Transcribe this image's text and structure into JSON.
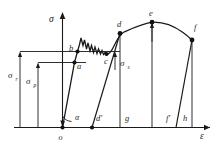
{
  "figure": {
    "background_color": "#ffffff",
    "line_color": "#1a1a1a"
  },
  "axes": {
    "y_axis_label": "σ",
    "x_axis_label": "ε",
    "origin_label": "o",
    "angle_label": "α"
  },
  "stress_markers": [
    {
      "name": "sigma-r",
      "symbol": "σ",
      "subscript": "r",
      "level": "upper"
    },
    {
      "name": "sigma-p",
      "symbol": "σ",
      "subscript": "p",
      "level": "lower"
    },
    {
      "name": "sigma-s",
      "symbol": "σ",
      "subscript": "s",
      "level": "upper-right"
    }
  ],
  "curve_points": [
    {
      "label": "a",
      "name": "point-a",
      "desc": "proportional limit"
    },
    {
      "label": "b",
      "name": "point-b",
      "desc": "upper yield point"
    },
    {
      "label": "c",
      "name": "point-c",
      "desc": "end of yield plateau"
    },
    {
      "label": "d",
      "name": "point-d",
      "desc": "strain hardening"
    },
    {
      "label": "e",
      "name": "point-e",
      "desc": "ultimate tensile strength"
    },
    {
      "label": "f",
      "name": "point-f",
      "desc": "fracture point"
    }
  ],
  "baseline_labels": [
    {
      "label": "d′",
      "name": "baseline-d-prime"
    },
    {
      "label": "g",
      "name": "baseline-g"
    },
    {
      "label": "f′",
      "name": "baseline-f-prime"
    },
    {
      "label": "h",
      "name": "baseline-h"
    }
  ]
}
